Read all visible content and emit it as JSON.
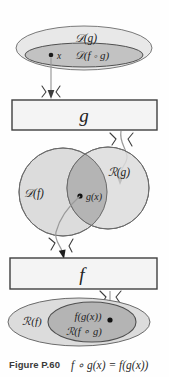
{
  "figure": {
    "caption_label": "Figure P.60",
    "caption_formula": "f ∘ g(x) = f(g(x))",
    "title_alt": "Composition of functions domain and range diagram"
  },
  "colors": {
    "outline": "#555555",
    "outer_fill": "#e6e6e6",
    "inner_fill": "#bdbdbd",
    "mid_fill": "#d7d7d7",
    "overlap_fill": "#a8a8a8",
    "box_fill": "#f2f2f2",
    "box_stroke": "#4a4a4a",
    "arrow": "#8a8a8a",
    "text": "#222222",
    "background": "#ffffff"
  },
  "top_region": {
    "name": "domain-of-g-region",
    "outer_label": "𝒟(g)",
    "inner_label": "𝒟(f ∘ g)",
    "point_label": "x"
  },
  "box_g": {
    "name": "function-box-g",
    "label": "g"
  },
  "middle_region": {
    "name": "domain-f-range-g-region",
    "left_label": "𝒟(f)",
    "right_label": "ℛ(g)",
    "point_label": "g(x)"
  },
  "box_f": {
    "name": "function-box-f",
    "label": "f"
  },
  "bottom_region": {
    "name": "range-of-f-region",
    "outer_label": "ℛ(f)",
    "inner_label_top": "f(g(x))",
    "inner_label_bottom": "ℛ(f ∘ g)"
  },
  "arrows": [
    {
      "name": "arrow-x-to-g",
      "from": "x",
      "to": "box-g"
    },
    {
      "name": "arrow-g-to-gx",
      "from": "box-g",
      "to": "g(x)"
    },
    {
      "name": "arrow-gx-to-f",
      "from": "g(x)",
      "to": "box-f"
    },
    {
      "name": "arrow-f-to-fgx",
      "from": "box-f",
      "to": "f(g(x))"
    }
  ]
}
